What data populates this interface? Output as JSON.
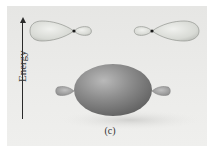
{
  "diagram": {
    "type": "orbital-energy-diagram",
    "axis": {
      "label": "Energy",
      "direction": "up"
    },
    "caption": "(c)",
    "upper_level": [
      {
        "name": "left-hybrid-orbital",
        "large_lobe": "left",
        "small_lobe": "right",
        "color": "#d9dbd6"
      },
      {
        "name": "right-hybrid-orbital",
        "large_lobe": "right",
        "small_lobe": "left",
        "color": "#d9dbd6"
      }
    ],
    "lower_level": {
      "name": "bonding-orbital",
      "shape": "large ellipsoid with small side lobes",
      "color": "#8c8c8c"
    },
    "colors": {
      "background": "#e9e9e7",
      "upper_orbital_fill": "#d9dbd6",
      "upper_orbital_stroke": "#9a9c97",
      "lower_orbital_fill": "#8a8a8a",
      "nucleus": "#1a1a1a"
    }
  }
}
